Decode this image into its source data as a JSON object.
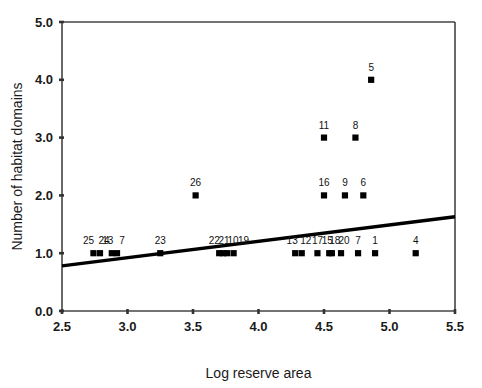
{
  "chart_data": {
    "type": "scatter",
    "title": "",
    "xlabel": "Log reserve area",
    "ylabel": "Number of habitat domains",
    "xlim": [
      2.5,
      5.5
    ],
    "ylim": [
      0.0,
      5.0
    ],
    "xticks": [
      "2.5",
      "3.0",
      "3.5",
      "4.0",
      "4.5",
      "5.0",
      "5.5"
    ],
    "xtick_values": [
      2.5,
      3.0,
      3.5,
      4.0,
      4.5,
      5.0,
      5.5
    ],
    "yticks": [
      "0.0",
      "1.0",
      "2.0",
      "3.0",
      "4.0",
      "5.0"
    ],
    "ytick_values": [
      0.0,
      1.0,
      2.0,
      3.0,
      4.0,
      5.0
    ],
    "grid": false,
    "legend": "none",
    "marker_shape": "square",
    "marker_color": "#000000",
    "points": [
      {
        "label": "25",
        "x": 2.74,
        "y": 1.0,
        "label_dx": -5,
        "label_dy": -9
      },
      {
        "label": "24",
        "x": 2.79,
        "y": 1.0,
        "label_dx": 4,
        "label_dy": -9
      },
      {
        "label": "13",
        "x": 2.88,
        "y": 1.0,
        "label_dx": -4,
        "label_dy": -9
      },
      {
        "label": "7",
        "x": 2.92,
        "y": 1.0,
        "label_dx": 5,
        "label_dy": -9
      },
      {
        "label": "23",
        "x": 3.25,
        "y": 1.0,
        "label_dx": 0,
        "label_dy": -9
      },
      {
        "label": "26",
        "x": 3.52,
        "y": 2.0,
        "label_dx": 0,
        "label_dy": -9
      },
      {
        "label": "22",
        "x": 3.7,
        "y": 1.0,
        "label_dx": -5,
        "label_dy": -9
      },
      {
        "label": "21",
        "x": 3.73,
        "y": 1.0,
        "label_dx": 1,
        "label_dy": -9
      },
      {
        "label": "10",
        "x": 3.76,
        "y": 1.0,
        "label_dx": 6,
        "label_dy": -9
      },
      {
        "label": "19",
        "x": 3.81,
        "y": 1.0,
        "label_dx": 10,
        "label_dy": -9
      },
      {
        "label": "13",
        "x": 4.28,
        "y": 1.0,
        "label_dx": -3,
        "label_dy": -9
      },
      {
        "label": "12",
        "x": 4.33,
        "y": 1.0,
        "label_dx": 4,
        "label_dy": -9
      },
      {
        "label": "17",
        "x": 4.45,
        "y": 1.0,
        "label_dx": 0,
        "label_dy": -9
      },
      {
        "label": "15",
        "x": 4.54,
        "y": 1.0,
        "label_dx": -2,
        "label_dy": -9
      },
      {
        "label": "18",
        "x": 4.56,
        "y": 1.0,
        "label_dx": 3,
        "label_dy": -9
      },
      {
        "label": "20",
        "x": 4.63,
        "y": 1.0,
        "label_dx": 3,
        "label_dy": -9
      },
      {
        "label": "7",
        "x": 4.76,
        "y": 1.0,
        "label_dx": 0,
        "label_dy": -9
      },
      {
        "label": "1",
        "x": 4.89,
        "y": 1.0,
        "label_dx": 0,
        "label_dy": -9
      },
      {
        "label": "4",
        "x": 5.2,
        "y": 1.0,
        "label_dx": 0,
        "label_dy": -9
      },
      {
        "label": "16",
        "x": 4.5,
        "y": 2.0,
        "label_dx": 0,
        "label_dy": -9
      },
      {
        "label": "9",
        "x": 4.66,
        "y": 2.0,
        "label_dx": 0,
        "label_dy": -9
      },
      {
        "label": "6",
        "x": 4.8,
        "y": 2.0,
        "label_dx": 0,
        "label_dy": -9
      },
      {
        "label": "11",
        "x": 4.5,
        "y": 3.0,
        "label_dx": 0,
        "label_dy": -9
      },
      {
        "label": "8",
        "x": 4.74,
        "y": 3.0,
        "label_dx": 0,
        "label_dy": -9
      },
      {
        "label": "5",
        "x": 4.86,
        "y": 4.0,
        "label_dx": 0,
        "label_dy": -9
      }
    ],
    "trendline": {
      "x_start": 2.5,
      "y_start": 0.78,
      "x_end": 5.5,
      "y_end": 1.63,
      "color": "#000000"
    }
  }
}
